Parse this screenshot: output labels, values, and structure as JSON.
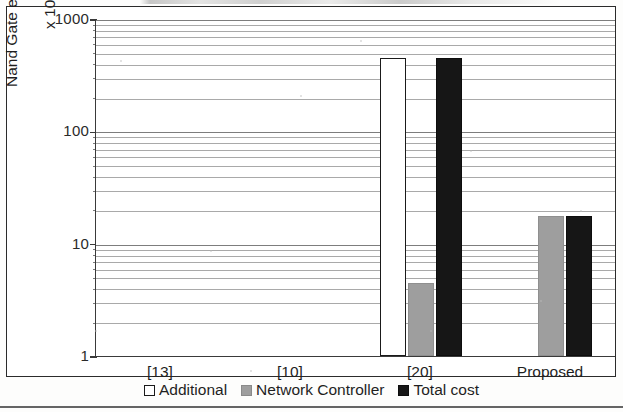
{
  "figure": {
    "y_axis_title": "Nand Gate eq. area (Log.)",
    "y_axis_units": "x 10000"
  },
  "legend": {
    "items": [
      {
        "label": "Additional",
        "swatch": "white-square-outline",
        "color": "#ffffff"
      },
      {
        "label": "Network Controller",
        "swatch": "gray-square",
        "color": "#9e9e9e"
      },
      {
        "label": "Total cost",
        "swatch": "black-square",
        "color": "#161616"
      }
    ]
  },
  "chart_data": {
    "type": "bar",
    "title": "",
    "xlabel": "",
    "ylabel": "Nand Gate eq. area (Log.)",
    "y_units": "x 10000",
    "log_scale": true,
    "ylim": [
      1,
      1000
    ],
    "ytick_labels": [
      "1000",
      "100",
      "10",
      "1"
    ],
    "yticks": [
      1000,
      100,
      10,
      1
    ],
    "grid": true,
    "legend_position": "bottom",
    "categories": [
      "[13]",
      "[10]",
      "[20]",
      "Proposed"
    ],
    "series": [
      {
        "name": "Additional",
        "values": [
          null,
          null,
          450,
          null
        ]
      },
      {
        "name": "Network Controller",
        "values": [
          null,
          null,
          4.5,
          17.6
        ]
      },
      {
        "name": "Total cost",
        "values": [
          null,
          null,
          450,
          17.6
        ]
      }
    ]
  }
}
